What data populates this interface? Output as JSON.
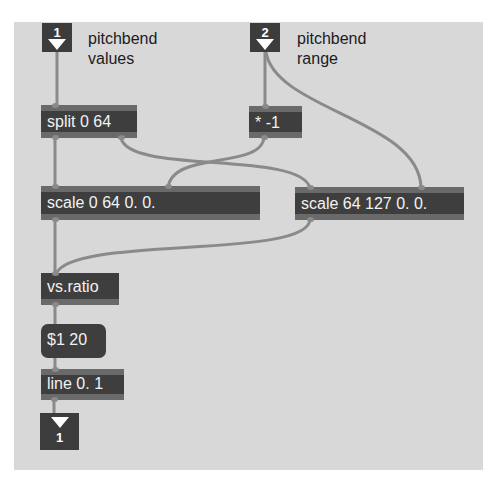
{
  "patch": {
    "background_color": "#d8d8d8",
    "object_color": "#3e3e3e",
    "cord_color": "#8a8a8a",
    "inlets": [
      {
        "number": "1",
        "comment_line1": "pitchbend",
        "comment_line2": "values"
      },
      {
        "number": "2",
        "comment_line1": "pitchbend",
        "comment_line2": "range"
      }
    ],
    "objects": {
      "split": "split 0 64",
      "times": "* -1",
      "scale_low": "scale 0 64 0. 0.",
      "scale_high": "scale 64 127 0. 0.",
      "vsratio": "vs.ratio",
      "line": "line 0. 1"
    },
    "message": "$1 20",
    "outlet": {
      "number": "1"
    },
    "connections": [
      {
        "from": "inlet 1",
        "to": "split 0 64 (left inlet)"
      },
      {
        "from": "inlet 2",
        "to": "* -1 (left inlet)"
      },
      {
        "from": "inlet 2",
        "to": "scale 64 127 0. 0. (4th inlet)"
      },
      {
        "from": "split 0 64 (left outlet)",
        "to": "scale 0 64 0. 0. (left inlet)"
      },
      {
        "from": "split 0 64 (right outlet)",
        "to": "scale 64 127 0. 0. (left inlet)"
      },
      {
        "from": "* -1 (outlet)",
        "to": "scale 0 64 0. 0. (3rd inlet)"
      },
      {
        "from": "scale 0 64 0. 0. (outlet)",
        "to": "vs.ratio"
      },
      {
        "from": "scale 64 127 0. 0. (outlet)",
        "to": "vs.ratio"
      },
      {
        "from": "vs.ratio",
        "to": "$1 20"
      },
      {
        "from": "$1 20",
        "to": "line 0. 1"
      },
      {
        "from": "line 0. 1",
        "to": "outlet 1"
      }
    ]
  }
}
